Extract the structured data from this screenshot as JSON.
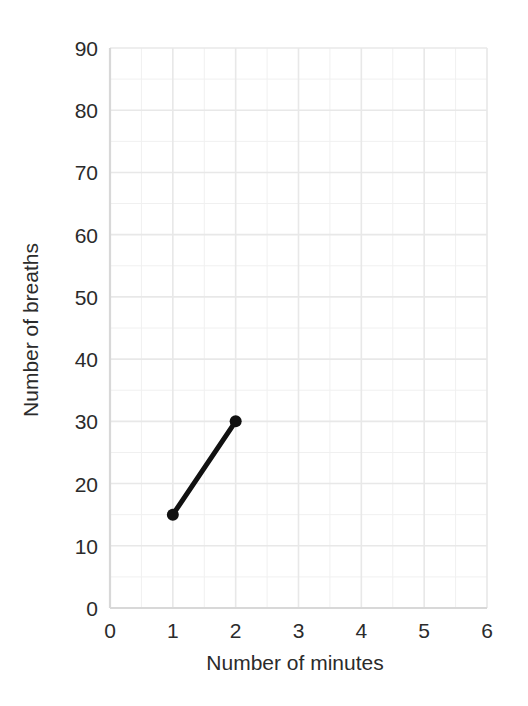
{
  "chart_data": {
    "type": "line",
    "title": "",
    "subtitle": "",
    "xlabel": "Number of minutes",
    "ylabel": "Number of breaths",
    "xlim": [
      0,
      6
    ],
    "ylim": [
      0,
      90
    ],
    "x_ticks": [
      0,
      1,
      2,
      3,
      4,
      5,
      6
    ],
    "x_tick_labels": [
      "0",
      "1",
      "2",
      "3",
      "4",
      "5",
      "6"
    ],
    "y_ticks": [
      0,
      10,
      20,
      30,
      40,
      50,
      60,
      70,
      80,
      90
    ],
    "y_tick_labels": [
      "0",
      "10",
      "20",
      "30",
      "40",
      "50",
      "60",
      "70",
      "80",
      "90"
    ],
    "x_minor_step": 0.5,
    "y_minor_step": 5,
    "grid": true,
    "grid_color": "#e8e8e8",
    "minor_grid_color": "#f0f0f0",
    "legend": false,
    "legend_position": "none",
    "annotations": [],
    "series": [
      {
        "name": "breaths over time",
        "color": "#111111",
        "line_width": 5,
        "marker": "circle",
        "marker_size": 9,
        "x": [
          1,
          2
        ],
        "y": [
          15,
          30
        ],
        "points": [
          {
            "x": 1,
            "y": 15
          },
          {
            "x": 2,
            "y": 30
          }
        ]
      }
    ]
  },
  "axes": {
    "x_axis_name": "Number of minutes",
    "y_axis_name": "Number of breaths"
  }
}
